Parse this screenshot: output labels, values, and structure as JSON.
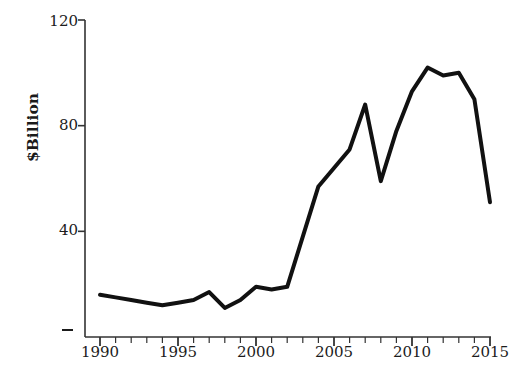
{
  "chart_data": {
    "type": "line",
    "title": "",
    "xlabel": "",
    "ylabel": "$Billion",
    "x": [
      1990,
      1991,
      1992,
      1993,
      1994,
      1995,
      1996,
      1997,
      1998,
      1999,
      2000,
      2001,
      2002,
      2003,
      2004,
      2005,
      2006,
      2007,
      2008,
      2009,
      2010,
      2011,
      2012,
      2013,
      2014,
      2015
    ],
    "values": [
      16,
      15,
      14,
      13,
      12,
      13,
      14,
      17,
      11,
      14,
      19,
      18,
      19,
      38,
      57,
      64,
      71,
      88,
      59,
      78,
      93,
      102,
      99,
      100,
      90,
      51
    ],
    "series": [
      {
        "name": "$Billion",
        "values": [
          16,
          15,
          14,
          13,
          12,
          13,
          14,
          17,
          11,
          14,
          19,
          18,
          19,
          38,
          57,
          64,
          71,
          88,
          59,
          78,
          93,
          102,
          99,
          100,
          90,
          51
        ]
      }
    ],
    "xlim": [
      1990,
      2015
    ],
    "ylim": [
      0,
      120
    ],
    "ytick_values": [
      0,
      40,
      80,
      120
    ],
    "ytick_labels": [
      "",
      "40",
      "80",
      "120"
    ],
    "xtick_values": [
      1990,
      1995,
      2000,
      2005,
      2010,
      2015
    ],
    "xtick_labels": [
      "1990",
      "1995",
      "2000",
      "2005",
      "2010",
      "2015"
    ],
    "xtick_minor_step": 1,
    "grid": false,
    "legend": "none",
    "line_color": "#111111",
    "line_width": 4,
    "axis_color": "#333333"
  },
  "axis": {
    "ylabel_text": "$Billion",
    "ytick_120": "120",
    "ytick_80": "80",
    "ytick_40": "40",
    "xtick_1990": "1990",
    "xtick_1995": "1995",
    "xtick_2000": "2000",
    "xtick_2005": "2005",
    "xtick_2010": "2010",
    "xtick_2015": "2015"
  }
}
